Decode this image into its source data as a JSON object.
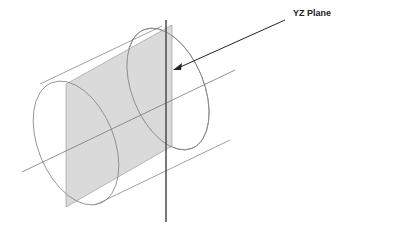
{
  "diagram": {
    "title": "YZ Plane",
    "annotations": [
      {
        "text": "YZ Plane",
        "points_to": "yz-plane"
      }
    ],
    "elements": [
      "cylinder",
      "yz-plane",
      "axis-line",
      "vertical-line",
      "arrow"
    ],
    "colors": {
      "plane_fill": "#d6d6d6",
      "outline": "#777777",
      "axis": "#555555"
    }
  }
}
